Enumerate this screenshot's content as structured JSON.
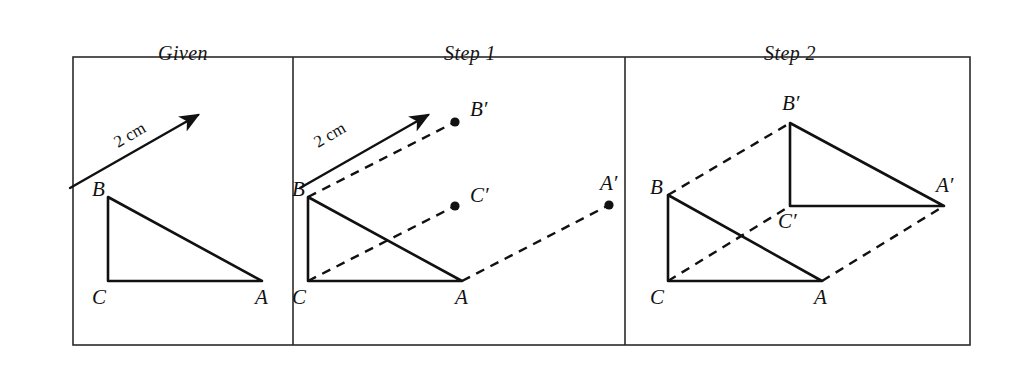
{
  "figure": {
    "type": "geometry-construction-diagram",
    "frame": {
      "left": 73,
      "top": 57,
      "right": 970,
      "bottom": 345,
      "divider_x": [
        293,
        625
      ]
    },
    "panels": [
      {
        "id": "given",
        "title": "Given",
        "title_x": 183,
        "title_y": 42,
        "vector": {
          "label": "2 cm",
          "label_x": 118,
          "label_y": 148,
          "label_rotation": -30,
          "from_x": 70,
          "from_y": 188,
          "to_x": 198,
          "to_y": 115
        },
        "triangle": {
          "vertices": [
            {
              "name": "B",
              "x": 108,
              "y": 197,
              "label": "B",
              "label_x": 92,
              "label_y": 196
            },
            {
              "name": "C",
              "x": 108,
              "y": 281,
              "label": "C",
              "label_x": 92,
              "label_y": 304
            },
            {
              "name": "A",
              "x": 262,
              "y": 281,
              "label": "A",
              "label_x": 255,
              "label_y": 304
            }
          ]
        }
      },
      {
        "id": "step1",
        "title": "Step 1",
        "title_x": 470,
        "title_y": 42,
        "vector": {
          "label": "2 cm",
          "label_x": 318,
          "label_y": 148,
          "label_rotation": -30,
          "from_x": 300,
          "from_y": 188,
          "to_x": 428,
          "to_y": 115
        },
        "triangle": {
          "vertices": [
            {
              "name": "B",
              "x": 308,
              "y": 197,
              "label": "B",
              "label_x": 292,
              "label_y": 196
            },
            {
              "name": "C",
              "x": 308,
              "y": 281,
              "label": "C",
              "label_x": 292,
              "label_y": 304
            },
            {
              "name": "A",
              "x": 462,
              "y": 281,
              "label": "A",
              "label_x": 455,
              "label_y": 304
            }
          ]
        },
        "image_points": [
          {
            "name": "B-prime",
            "x": 455,
            "y": 122,
            "label": "B′",
            "label_x": 470,
            "label_y": 116,
            "from_x": 308,
            "from_y": 197
          },
          {
            "name": "C-prime",
            "x": 455,
            "y": 206,
            "label": "C′",
            "label_x": 470,
            "label_y": 202,
            "from_x": 308,
            "from_y": 281
          },
          {
            "name": "A-prime",
            "x": 609,
            "y": 205,
            "label": "A′",
            "label_x": 600,
            "label_y": 190,
            "from_x": 462,
            "from_y": 281
          }
        ]
      },
      {
        "id": "step2",
        "title": "Step 2",
        "title_x": 790,
        "title_y": 42,
        "triangle": {
          "vertices": [
            {
              "name": "B",
              "x": 668,
              "y": 195,
              "label": "B",
              "label_x": 650,
              "label_y": 194
            },
            {
              "name": "C",
              "x": 668,
              "y": 281,
              "label": "C",
              "label_x": 650,
              "label_y": 304
            },
            {
              "name": "A",
              "x": 822,
              "y": 281,
              "label": "A",
              "label_x": 814,
              "label_y": 304
            }
          ]
        },
        "image_triangle": {
          "vertices": [
            {
              "name": "B-prime",
              "x": 790,
              "y": 123,
              "label": "B′",
              "label_x": 782,
              "label_y": 110,
              "from_x": 668,
              "from_y": 195
            },
            {
              "name": "C-prime",
              "x": 790,
              "y": 206,
              "label": "C′",
              "label_x": 778,
              "label_y": 228,
              "from_x": 668,
              "from_y": 281
            },
            {
              "name": "A-prime",
              "x": 944,
              "y": 206,
              "label": "A′",
              "label_x": 936,
              "label_y": 192,
              "from_x": 822,
              "from_y": 281
            }
          ]
        }
      }
    ],
    "colors": {
      "ink": "#111111",
      "frame": "#2b2b2b",
      "background": "#ffffff"
    }
  }
}
